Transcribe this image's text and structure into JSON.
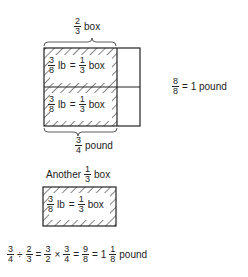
{
  "top_label": {
    "num": "2",
    "den": "3",
    "unit": "box"
  },
  "cell_label": {
    "num1": "3",
    "den1": "8",
    "lb": "lb",
    "eq": "=",
    "num2": "1",
    "den2": "3",
    "unit": "box"
  },
  "right_label": {
    "num": "8",
    "den": "8",
    "text": "= 1 pound"
  },
  "bottom_label": {
    "num": "3",
    "den": "4",
    "unit": "pound"
  },
  "another_label": {
    "prefix": "Another",
    "num": "1",
    "den": "3",
    "unit": "box"
  },
  "equation": {
    "a_num": "3",
    "a_den": "4",
    "div": "÷",
    "b_num": "2",
    "b_den": "3",
    "eq1": "=",
    "c_num": "3",
    "c_den": "2",
    "times": "×",
    "d_num": "3",
    "d_den": "4",
    "eq2": "=",
    "e_num": "9",
    "e_den": "8",
    "eq3": "= 1",
    "f_num": "1",
    "f_den": "8",
    "unit": "pound"
  }
}
